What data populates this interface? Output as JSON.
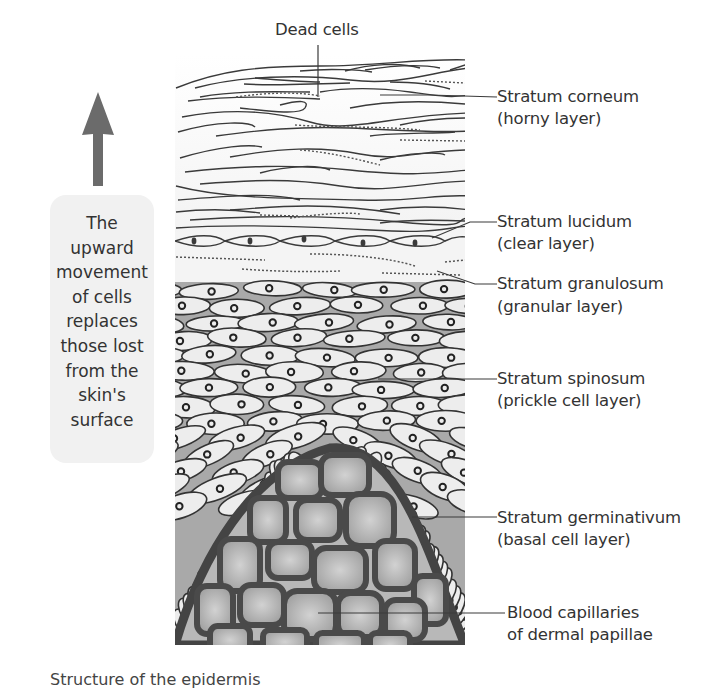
{
  "figure": {
    "title_label": "Dead cells",
    "side_note": {
      "lines": [
        "The",
        "upward",
        "movement",
        "of cells",
        "replaces",
        "those lost",
        "from the",
        "skin's",
        "surface"
      ],
      "text": "The upward movement of cells replaces those lost from the skin's surface",
      "arrow_direction": "up",
      "arrow_color": "#6b6b6b"
    },
    "layers": [
      {
        "name": "Stratum corneum",
        "alias": "(horny layer)"
      },
      {
        "name": "Stratum lucidum",
        "alias": "(clear layer)"
      },
      {
        "name": "Stratum granulosum",
        "alias": "(granular layer)"
      },
      {
        "name": "Stratum spinosum",
        "alias": "(prickle cell layer)"
      },
      {
        "name": "Stratum germinativum",
        "alias": "(basal cell layer)"
      },
      {
        "name": "Blood capillaries",
        "alias": "of dermal papillae"
      }
    ],
    "caption_partial": "Structure of the epidermis",
    "colors": {
      "outline": "#3a3a3a",
      "capillary": "#4a4a4a",
      "cell_fill": "#ededed",
      "matrix_fill": "#a9a9a9",
      "papilla_fill": "#b8b8b8",
      "side_box": "#f1f1f1"
    }
  }
}
